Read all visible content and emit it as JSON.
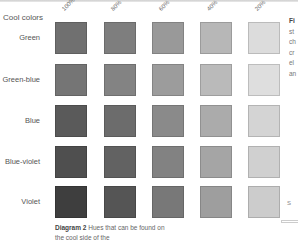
{
  "heading": "Cool colors",
  "columns": [
    "100%",
    "80%",
    "60%",
    "40%",
    "20%"
  ],
  "rows": [
    {
      "label": "Green",
      "colors": [
        "#707070",
        "#7e7e7e",
        "#999999",
        "#b7b7b7",
        "#dcdcdc"
      ]
    },
    {
      "label": "Green-blue",
      "colors": [
        "#757575",
        "#838383",
        "#9c9c9c",
        "#bababa",
        "#dedede"
      ]
    },
    {
      "label": "Blue",
      "colors": [
        "#5a5a5a",
        "#6c6c6c",
        "#8a8a8a",
        "#ababab",
        "#d4d4d4"
      ]
    },
    {
      "label": "Blue-violet",
      "colors": [
        "#4f4f4f",
        "#626262",
        "#828282",
        "#a5a5a5",
        "#d0d0d0"
      ]
    },
    {
      "label": "Violet",
      "colors": [
        "#3e3e3e",
        "#555555",
        "#787878",
        "#9e9e9e",
        "#cccccc"
      ]
    }
  ],
  "caption": {
    "label": "Diagram 2",
    "text": "Hues that can be found on the cool side of the"
  },
  "side_text": [
    "Fi",
    "st",
    "ch",
    "cr",
    "el",
    "an"
  ],
  "side_mark": "S"
}
